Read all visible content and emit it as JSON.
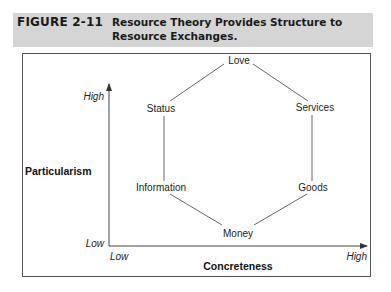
{
  "caption": {
    "figure_number": "FIGURE 2-11",
    "title": "Resource Theory Provides Structure to Resource Exchanges."
  },
  "axes": {
    "y": {
      "label": "Particularism",
      "high": "High",
      "low": "Low"
    },
    "x": {
      "label": "Concreteness",
      "high": "High",
      "low": "Low"
    }
  },
  "nodes": [
    {
      "id": "love",
      "label": "Love"
    },
    {
      "id": "services",
      "label": "Services"
    },
    {
      "id": "goods",
      "label": "Goods"
    },
    {
      "id": "money",
      "label": "Money"
    },
    {
      "id": "information",
      "label": "Information"
    },
    {
      "id": "status",
      "label": "Status"
    }
  ],
  "edges": [
    [
      "love",
      "services"
    ],
    [
      "services",
      "goods"
    ],
    [
      "goods",
      "money"
    ],
    [
      "money",
      "information"
    ],
    [
      "information",
      "status"
    ],
    [
      "status",
      "love"
    ]
  ]
}
